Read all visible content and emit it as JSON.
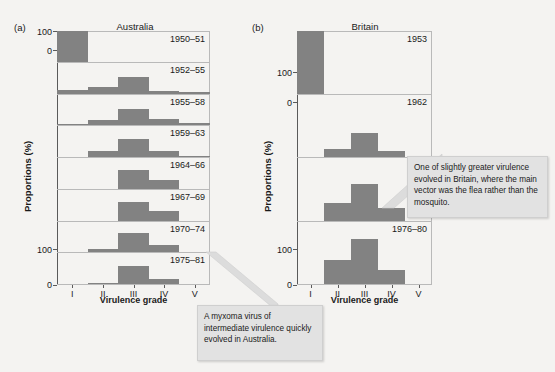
{
  "figure": {
    "ylabel": "Proportions (%)",
    "xlabel": "Virulence grade",
    "grades": [
      "I",
      "II",
      "III",
      "IV",
      "V"
    ],
    "yticks": [
      "100",
      "0"
    ],
    "bar_color": "#828282"
  },
  "panels": [
    {
      "tag": "(a)",
      "title": "Australia",
      "rows": [
        {
          "label": "1950–51"
        },
        {
          "label": "1952–55"
        },
        {
          "label": "1955–58"
        },
        {
          "label": "1959–63"
        },
        {
          "label": "1964–66"
        },
        {
          "label": "1967–69"
        },
        {
          "label": "1970–74"
        },
        {
          "label": "1975–81"
        }
      ]
    },
    {
      "tag": "(b)",
      "title": "Britain",
      "rows": [
        {
          "label": "1953"
        },
        {
          "label": "1962"
        },
        {
          "label": "1975"
        },
        {
          "label": "1976–80"
        }
      ]
    }
  ],
  "callouts": [
    {
      "id": "australia-note",
      "text": "A myxoma virus of intermediate virulence quickly evolved in Australia."
    },
    {
      "id": "britain-note",
      "text": "One of slightly greater virulence evolved in Britain, where the main vector was the flea rather than the mosquito."
    }
  ],
  "chart_data": {
    "type": "bar",
    "xlabel": "Virulence grade",
    "ylabel": "Proportions (%)",
    "categories": [
      "I",
      "II",
      "III",
      "IV",
      "V"
    ],
    "ylim": [
      0,
      100
    ],
    "grid": false,
    "legend": "none",
    "panels": [
      {
        "name": "Australia",
        "tag": "(a)",
        "series": [
          {
            "name": "1950–51",
            "values": [
              100,
              0,
              0,
              0,
              0
            ]
          },
          {
            "name": "1952–55",
            "values": [
              13,
              20,
              55,
              9,
              5
            ]
          },
          {
            "name": "1955–58",
            "values": [
              1,
              16,
              52,
              22,
              7
            ]
          },
          {
            "name": "1959–63",
            "values": [
              0,
              18,
              58,
              20,
              3
            ]
          },
          {
            "name": "1964–66",
            "values": [
              0,
              0,
              62,
              30,
              0
            ]
          },
          {
            "name": "1967–69",
            "values": [
              0,
              0,
              60,
              32,
              0
            ]
          },
          {
            "name": "1970–74",
            "values": [
              0,
              12,
              62,
              23,
              0
            ]
          },
          {
            "name": "1975–81",
            "values": [
              0,
              4,
              58,
              16,
              0
            ]
          }
        ]
      },
      {
        "name": "Britain",
        "tag": "(b)",
        "series": [
          {
            "name": "1953",
            "values": [
              100,
              0,
              0,
              0,
              0
            ]
          },
          {
            "name": "1962",
            "values": [
              0,
              13,
              38,
              10,
              0
            ]
          },
          {
            "name": "1975",
            "values": [
              0,
              28,
              58,
              20,
              0
            ]
          },
          {
            "name": "1976–80",
            "values": [
              0,
              38,
              72,
              22,
              0
            ]
          }
        ]
      }
    ]
  }
}
